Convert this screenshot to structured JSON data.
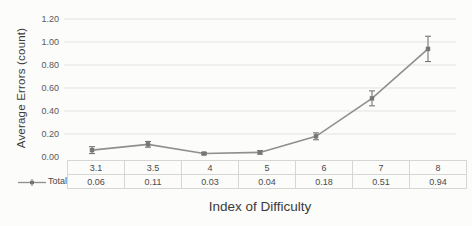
{
  "chart_data": {
    "type": "line",
    "title": "",
    "xlabel": "Index of Difficulty",
    "ylabel": "Average Errors (count)",
    "categories": [
      "3.1",
      "3.5",
      "4",
      "5",
      "6",
      "7",
      "8"
    ],
    "series": [
      {
        "name": "Total",
        "values": [
          0.06,
          0.11,
          0.03,
          0.04,
          0.18,
          0.51,
          0.94
        ],
        "error_bars": [
          0.03,
          0.025,
          0.01,
          0.015,
          0.03,
          0.065,
          0.11
        ],
        "color": "#8f8f8d"
      }
    ],
    "y_ticks": [
      "0.00",
      "0.20",
      "0.40",
      "0.60",
      "0.80",
      "1.00",
      "1.20"
    ],
    "ylim": [
      0,
      1.2
    ],
    "grid": true,
    "legend_position": "left-of-data-table",
    "data_table": true
  },
  "colors": {
    "line": "#8f8f8d",
    "marker": "#767674",
    "error_bar": "#767674",
    "grid": "#e3e3e1",
    "table_border": "#d6d6d4",
    "tick_text": "#595959",
    "title_text": "#3a3a3a",
    "background": "#fcfcfb"
  }
}
